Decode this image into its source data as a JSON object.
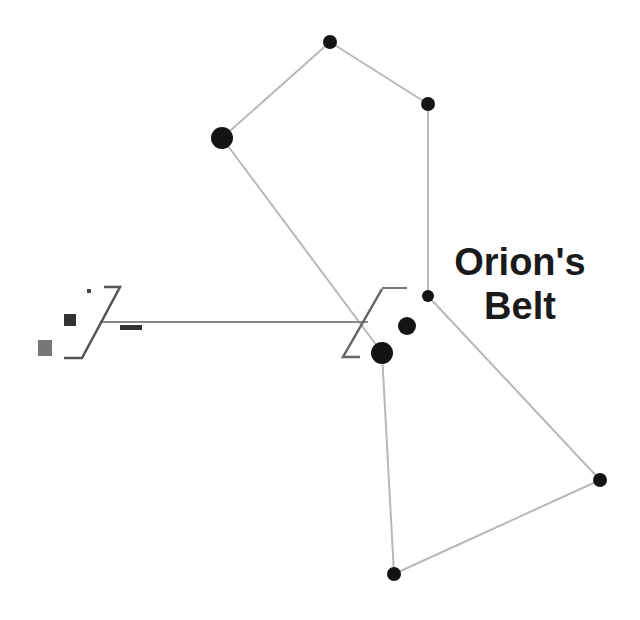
{
  "diagram": {
    "label_line1": "Orion's",
    "label_line2": "Belt",
    "line_color": "#b8b8b8",
    "star_color": "#141414",
    "stars": [
      {
        "name": "top",
        "x": 330,
        "y": 42,
        "r": 7
      },
      {
        "name": "right-shoulder",
        "x": 428,
        "y": 104,
        "r": 7
      },
      {
        "name": "left-shoulder",
        "x": 222,
        "y": 138,
        "r": 11
      },
      {
        "name": "belt-1",
        "x": 428,
        "y": 296,
        "r": 6
      },
      {
        "name": "belt-2",
        "x": 407,
        "y": 326,
        "r": 9
      },
      {
        "name": "belt-3",
        "x": 382,
        "y": 353,
        "r": 11
      },
      {
        "name": "right-foot",
        "x": 600,
        "y": 480,
        "r": 7
      },
      {
        "name": "left-foot",
        "x": 394,
        "y": 574,
        "r": 7
      }
    ]
  }
}
